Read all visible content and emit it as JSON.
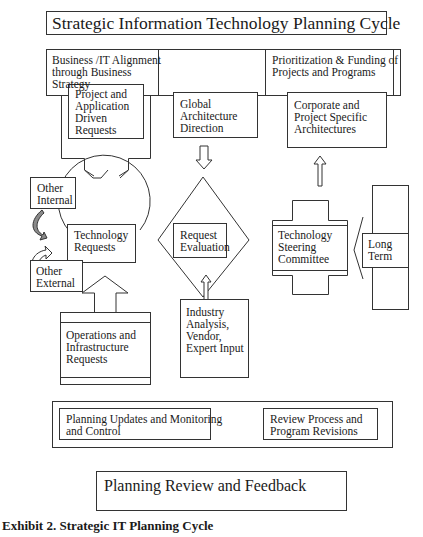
{
  "diagram": {
    "title": "Strategic  Information Technology Planning Cycle",
    "top_band": {
      "left_label": "Business /IT Alignment\nthrough Business\nStrategy",
      "right_label": "Prioritization & Funding of\nProjects and Programs"
    },
    "nodes": {
      "project_requests": "Project and\nApplication\nDriven\nRequests",
      "global_architecture": "Global\nArchitecture\nDirection",
      "corporate_architectures": "Corporate and\nProject Specific\nArchitectures",
      "other_internal": "Other\nInternal",
      "other_external": "Other\nExternal",
      "technology_requests": "Technology\nRequests",
      "request_evaluation": "Request\nEvaluation",
      "steering_committee": "Technology\nSteering\nCommittee",
      "long_term": "Long\nTerm",
      "operations_requests": "Operations and\nInfrastructure\nRequests",
      "industry_input": "Industry\nAnalysis,\nVendor,\nExpert Input"
    },
    "bottom_band": {
      "left_label": "Planning Updates and Monitoring\nand Control",
      "right_label": "Review Process and\nProgram Revisions"
    },
    "feedback_box": "Planning Review and Feedback",
    "edges": [
      {
        "from": "project_requests",
        "to": "technology_requests",
        "style": "block-arrow-down"
      },
      {
        "from": "global_architecture",
        "to": "request_evaluation",
        "style": "hollow-arrow-down"
      },
      {
        "from": "industry_input",
        "to": "request_evaluation",
        "style": "hollow-arrow-up"
      },
      {
        "from": "operations_requests",
        "to": "technology_requests",
        "style": "block-arrow-up"
      },
      {
        "from": "steering_committee",
        "to": "corporate_architectures",
        "style": "hollow-arrow-up"
      },
      {
        "from": "long_term",
        "to": "steering_committee",
        "style": "chevron-left"
      },
      {
        "from": "other_internal",
        "to": "technology_requests",
        "style": "curved-arrow"
      },
      {
        "from": "other_external",
        "to": "technology_requests",
        "style": "curved-arrow"
      }
    ]
  },
  "caption": "Exhibit 2. Strategic IT Planning Cycle",
  "colors": {
    "stroke": "#333333",
    "background": "#ffffff",
    "curved_arrow_fill": "#8a8a8a"
  }
}
